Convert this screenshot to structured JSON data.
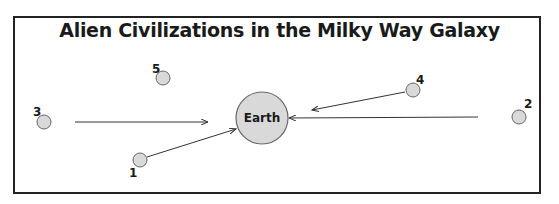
{
  "diagram": {
    "title": "Alien Civilizations in the Milky Way Galaxy",
    "center": {
      "label": "Earth",
      "x": 262,
      "y": 118,
      "r": 26,
      "fill": "#d9d9d9",
      "stroke": "#666666"
    },
    "civilizations": [
      {
        "id": "1",
        "label": "1",
        "x": 140,
        "y": 160,
        "r": 7,
        "lx": 129,
        "ly": 177
      },
      {
        "id": "2",
        "label": "2",
        "x": 519,
        "y": 117,
        "r": 7,
        "lx": 524,
        "ly": 108
      },
      {
        "id": "3",
        "label": "3",
        "x": 44,
        "y": 122,
        "r": 7,
        "lx": 33,
        "ly": 116
      },
      {
        "id": "4",
        "label": "4",
        "x": 413,
        "y": 90,
        "r": 7,
        "lx": 416,
        "ly": 84
      },
      {
        "id": "5",
        "label": "5",
        "x": 163,
        "y": 78,
        "r": 7,
        "lx": 152,
        "ly": 73
      }
    ],
    "arrows": [
      {
        "from": "3",
        "x1": 75,
        "y1": 122,
        "x2": 208,
        "y2": 122
      },
      {
        "from": "1",
        "x1": 147,
        "y1": 157,
        "x2": 236,
        "y2": 129
      },
      {
        "from": "4",
        "x1": 405,
        "y1": 92,
        "x2": 312,
        "y2": 110
      },
      {
        "from": "2",
        "x1": 478,
        "y1": 117,
        "x2": 289,
        "y2": 118
      }
    ]
  }
}
